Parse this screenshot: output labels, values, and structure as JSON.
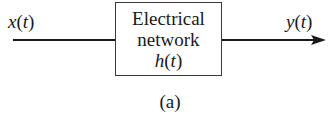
{
  "diagram": {
    "input": {
      "name": "x",
      "arg": "t"
    },
    "output": {
      "name": "y",
      "arg": "t"
    },
    "block": {
      "line1": "Electrical",
      "line2": "network",
      "function_name": "h",
      "function_arg": "t"
    },
    "caption": "(a)",
    "colors": {
      "stroke": "#1a1a1a",
      "box_border": "#3a3a3a",
      "background": "#ffffff"
    }
  }
}
